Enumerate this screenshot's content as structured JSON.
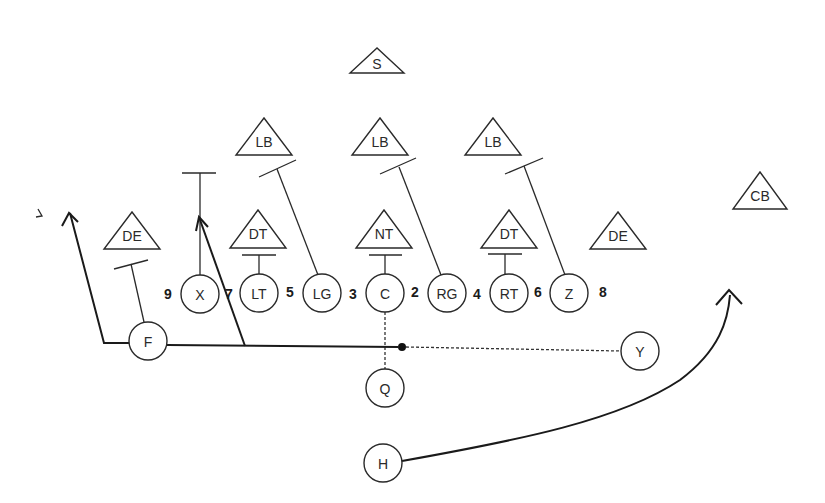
{
  "diagram": {
    "type": "football-play",
    "colors": {
      "line": "#2a2a2a",
      "background": "#ffffff"
    },
    "defense": [
      {
        "id": "s",
        "label": "S",
        "cx": 377,
        "apex": 48,
        "base": 73,
        "half": 27
      },
      {
        "id": "lb1",
        "label": "LB",
        "cx": 264,
        "apex": 118,
        "base": 155,
        "half": 28
      },
      {
        "id": "lb2",
        "label": "LB",
        "cx": 380,
        "apex": 118,
        "base": 155,
        "half": 28
      },
      {
        "id": "lb3",
        "label": "LB",
        "cx": 493,
        "apex": 118,
        "base": 155,
        "half": 28
      },
      {
        "id": "cb",
        "label": "CB",
        "cx": 760,
        "apex": 172,
        "base": 209,
        "half": 27
      },
      {
        "id": "de1",
        "label": "DE",
        "cx": 132,
        "apex": 212,
        "base": 249,
        "half": 28
      },
      {
        "id": "dt1",
        "label": "DT",
        "cx": 258,
        "apex": 210,
        "base": 248,
        "half": 28
      },
      {
        "id": "nt",
        "label": "NT",
        "cx": 384,
        "apex": 210,
        "base": 248,
        "half": 28
      },
      {
        "id": "dt2",
        "label": "DT",
        "cx": 509,
        "apex": 210,
        "base": 248,
        "half": 28
      },
      {
        "id": "de2",
        "label": "DE",
        "cx": 618,
        "apex": 212,
        "base": 249,
        "half": 28
      }
    ],
    "offense": [
      {
        "id": "x",
        "label": "X",
        "cx": 200,
        "cy": 294,
        "r": 19
      },
      {
        "id": "lt",
        "label": "LT",
        "cx": 259,
        "cy": 293,
        "r": 19
      },
      {
        "id": "lg",
        "label": "LG",
        "cx": 322,
        "cy": 293,
        "r": 19
      },
      {
        "id": "c",
        "label": "C",
        "cx": 385,
        "cy": 293,
        "r": 19
      },
      {
        "id": "rg",
        "label": "RG",
        "cx": 447,
        "cy": 293,
        "r": 19
      },
      {
        "id": "rt",
        "label": "RT",
        "cx": 509,
        "cy": 293,
        "r": 19
      },
      {
        "id": "z",
        "label": "Z",
        "cx": 569,
        "cy": 293,
        "r": 19
      },
      {
        "id": "f",
        "label": "F",
        "cx": 148,
        "cy": 341,
        "r": 19
      },
      {
        "id": "q",
        "label": "Q",
        "cx": 385,
        "cy": 388,
        "r": 19
      },
      {
        "id": "y",
        "label": "Y",
        "cx": 640,
        "cy": 351,
        "r": 19
      },
      {
        "id": "h",
        "label": "H",
        "cx": 383,
        "cy": 463,
        "r": 19
      }
    ],
    "gap_numbers": [
      {
        "label": "9",
        "x": 168,
        "y": 294
      },
      {
        "label": "7",
        "x": 229,
        "y": 294
      },
      {
        "label": "5",
        "x": 290,
        "y": 292
      },
      {
        "label": "3",
        "x": 353,
        "y": 294
      },
      {
        "label": "2",
        "x": 415,
        "y": 292
      },
      {
        "label": "4",
        "x": 477,
        "y": 294
      },
      {
        "label": "6",
        "x": 538,
        "y": 292
      },
      {
        "label": "8",
        "x": 603,
        "y": 292
      }
    ],
    "stray_mark": {
      "label": "ˎ",
      "x": 40,
      "y": 215
    }
  }
}
